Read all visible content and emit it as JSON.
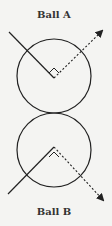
{
  "diagram": {
    "balls": [
      {
        "label": "Ball A",
        "incoming": "solid line from upper-left to center",
        "outgoing": "dotted arrow to upper-right",
        "right_angle_marker": true
      },
      {
        "label": "Ball B",
        "incoming": "solid line from lower-left to center",
        "outgoing": "dotted arrow to lower-right",
        "right_angle_marker": true
      }
    ],
    "colors": {
      "stroke": "#222222",
      "background": "#f4f4f2"
    }
  }
}
